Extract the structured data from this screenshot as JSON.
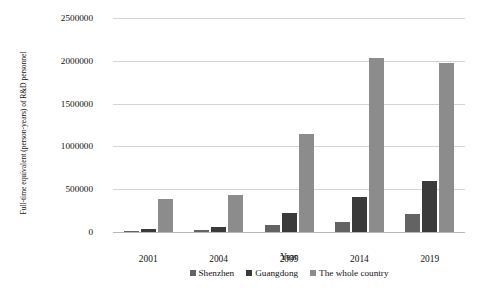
{
  "chart_data": {
    "type": "bar",
    "title": "",
    "subtitle": "",
    "xlabel": "Year",
    "ylabel": "Full-time equivalent (person-years) of R&D personnel",
    "categories": [
      "2001",
      "2004",
      "2009",
      "2014",
      "2019"
    ],
    "series": [
      {
        "name": "Shenzhen",
        "color": "#636363",
        "values": [
          10000,
          20000,
          85000,
          120000,
          215000
        ]
      },
      {
        "name": "Guangdong",
        "color": "#3a3a3a",
        "values": [
          40000,
          55000,
          225000,
          410000,
          600000
        ]
      },
      {
        "name": "The whole country",
        "color": "#8c8c8c",
        "values": [
          380000,
          430000,
          1150000,
          2030000,
          1975000
        ]
      }
    ],
    "ylim": [
      0,
      2500000
    ],
    "y_ticks": [
      "0",
      "500000",
      "1000000",
      "1500000",
      "2000000",
      "2500000"
    ],
    "y_tick_values": [
      0,
      500000,
      1000000,
      1500000,
      2000000,
      2500000
    ],
    "grid": true,
    "legend_position": "bottom",
    "annotations": []
  },
  "bottom_caption": ""
}
